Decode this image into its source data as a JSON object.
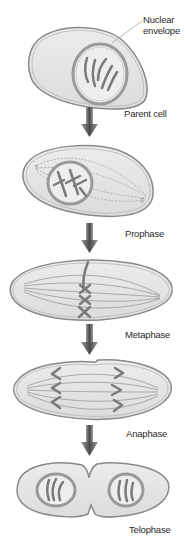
{
  "diagram": {
    "type": "mitosis-stages",
    "callout": {
      "line1": "Nuclear",
      "line2": "envelope"
    },
    "stages": [
      {
        "label": "Parent cell"
      },
      {
        "label": "Prophase"
      },
      {
        "label": "Metaphase"
      },
      {
        "label": "Anaphase"
      },
      {
        "label": "Telophase"
      }
    ],
    "colors": {
      "cell_fill": "#e6e6e6",
      "cell_outline": "#8a8a8a",
      "chromosome": "#7a7a7a",
      "spindle": "#9c9c9c",
      "arrow": "#555555",
      "text": "#2a2a2a"
    }
  }
}
